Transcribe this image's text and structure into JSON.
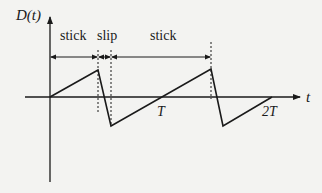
{
  "diagram": {
    "y_axis_label": "D(t)",
    "x_axis_label": "t",
    "phases": [
      {
        "label": "stick"
      },
      {
        "label": "slip"
      },
      {
        "label": "stick"
      }
    ],
    "ticks": [
      {
        "label": "T"
      },
      {
        "label": "2T"
      }
    ],
    "colors": {
      "line": "#1a1a1a",
      "background": "#f3f3f1"
    }
  }
}
